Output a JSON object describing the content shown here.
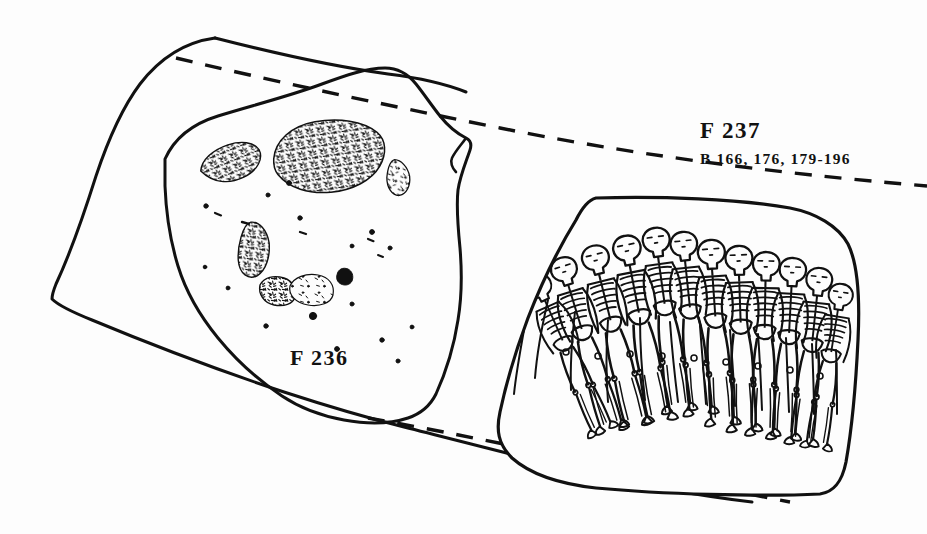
{
  "figure": {
    "kind": "archaeological-site-plan",
    "background_color": "#fdfdfd",
    "ink_color": "#111111"
  },
  "labels": {
    "feature_left": "F 236",
    "feature_right": "F 237",
    "burial_numbers": "B  166,  176,  179-196"
  },
  "left_plan": {
    "name": "F 236",
    "bone_scatters": [
      {
        "id": "scatter-west",
        "cx": 231,
        "cy": 163,
        "rx": 31,
        "ry": 18,
        "rot": -22,
        "density": "high"
      },
      {
        "id": "scatter-central-main",
        "cx": 330,
        "cy": 157,
        "rx": 56,
        "ry": 36,
        "rot": -8,
        "density": "very-high"
      },
      {
        "id": "scatter-east-sliver",
        "cx": 399,
        "cy": 178,
        "rx": 12,
        "ry": 17,
        "rot": 12,
        "density": "medium"
      },
      {
        "id": "scatter-southwest-upper",
        "cx": 255,
        "cy": 250,
        "rx": 15,
        "ry": 27,
        "rot": 8,
        "density": "high"
      },
      {
        "id": "scatter-southwest-lower",
        "cx": 278,
        "cy": 291,
        "rx": 18,
        "ry": 15,
        "rot": -5,
        "density": "high"
      },
      {
        "id": "scatter-south-centre",
        "cx": 312,
        "cy": 290,
        "rx": 22,
        "ry": 16,
        "rot": 0,
        "density": "medium"
      },
      {
        "id": "scatter-east-speck",
        "cx": 345,
        "cy": 277,
        "rx": 8,
        "ry": 9,
        "rot": 0,
        "density": "low"
      }
    ]
  },
  "right_detail": {
    "name": "F 237",
    "type": "mass-grave-inset",
    "skeleton_count": 12,
    "skeleton_orientation": "skulls along upper edge, long bones extending downward"
  },
  "leader_lines": [
    {
      "id": "leader-upper",
      "from": [
        176,
        58
      ],
      "to": [
        928,
        186
      ],
      "style": "dashed"
    },
    {
      "id": "leader-lower",
      "from": [
        368,
        418
      ],
      "to": [
        790,
        502
      ],
      "style": "dashed"
    }
  ]
}
